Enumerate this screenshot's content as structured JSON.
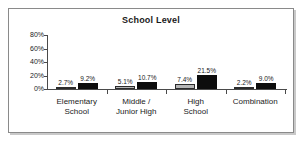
{
  "chart_data": {
    "type": "bar",
    "title": "School Level",
    "xlabel": "",
    "ylabel": "",
    "ylim": [
      0,
      80
    ],
    "grid": false,
    "legend_position": "none",
    "categories": [
      "Elementary School",
      "Middle / Junior High",
      "High School",
      "Combination"
    ],
    "category_lines": [
      [
        "Elementary",
        "School"
      ],
      [
        "Middle /",
        "Junior High"
      ],
      [
        "High",
        "School"
      ],
      [
        "Combination"
      ]
    ],
    "ytick_labels": [
      "80%",
      "60%",
      "40%",
      "20%",
      "0%"
    ],
    "ytick_values": [
      80,
      60,
      40,
      20,
      0
    ],
    "series": [
      {
        "name": "series-a",
        "color": "#b6b6b6",
        "values": [
          2.7,
          5.1,
          7.4,
          2.2
        ],
        "labels": [
          "2.7%",
          "5.1%",
          "7.4%",
          "2.2%"
        ]
      },
      {
        "name": "series-b",
        "color": "#0d0d0d",
        "values": [
          9.2,
          10.7,
          21.5,
          9.0
        ],
        "labels": [
          "9.2%",
          "10.7%",
          "21.5%",
          "9.0%"
        ]
      }
    ]
  },
  "panel": {
    "border_color": "#8a8a8a",
    "background": "#ffffff",
    "shadow_color": "#c9c9c9"
  }
}
